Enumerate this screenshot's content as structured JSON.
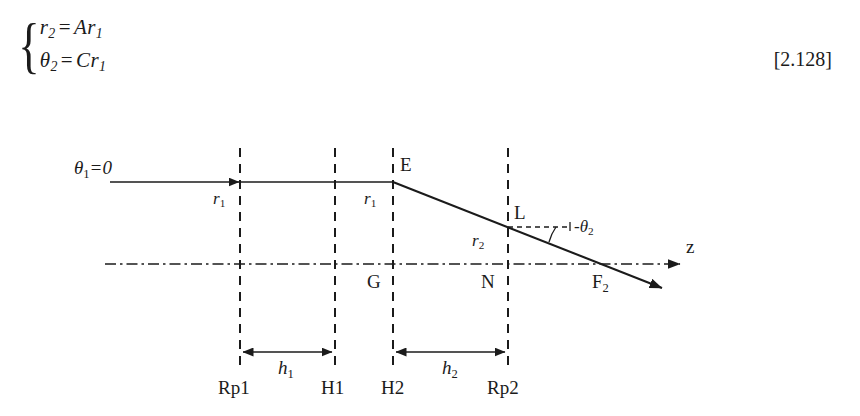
{
  "equation": {
    "brace": "{",
    "line1": {
      "lhs": "r",
      "lhs_sub": "2",
      "op": "=",
      "rhs_coeff": "A",
      "rhs_var": "r",
      "rhs_sub": "1"
    },
    "line2": {
      "lhs": "θ",
      "lhs_sub": "2",
      "op": "=",
      "rhs_coeff": "C",
      "rhs_var": "r",
      "rhs_sub": "1"
    },
    "number": "[2.128]"
  },
  "diagram": {
    "labels": {
      "theta1": "θ1=0",
      "r1_first": "r1",
      "r1_second": "r1",
      "r2": "r2",
      "point_E": "E",
      "point_L": "L",
      "point_G": "G",
      "point_N": "N",
      "point_F2": "F2",
      "minus_theta2": "-θ2",
      "axis": "z",
      "h1": "h1",
      "h2": "h2",
      "Rp1": "Rp1",
      "H1": "H1",
      "H2": "H2",
      "Rp2": "Rp2"
    },
    "colors": {
      "stroke": "#1b1b1b",
      "background": "#ffffff"
    },
    "geometry": {
      "axis_y": 264,
      "incoming_ray_y": 182,
      "planes_x": {
        "Rp1": 240,
        "H1": 335,
        "H2": 393,
        "Rp2": 508
      },
      "E_x": 393,
      "L_x": 508,
      "F2_x": 617,
      "h1_arrow_y": 352,
      "h2_arrow_y": 352,
      "plane_label_y": 392
    }
  }
}
